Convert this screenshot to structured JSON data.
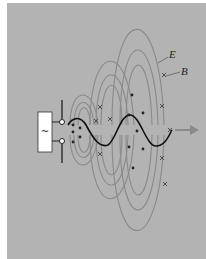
{
  "figure": {
    "labels": {
      "electric_field": "E",
      "magnetic_field": "B",
      "source_symbol": "~"
    },
    "colors": {
      "background": "#b3b3b3",
      "field_lines": "#8a8a8a",
      "wave": "#111111",
      "source_box": "#ffffff",
      "arrow": "#8a8a8a"
    },
    "legend": [
      {
        "symbol": "dot",
        "meaning": "B field out of page"
      },
      {
        "symbol": "cross",
        "meaning": "B field into page"
      }
    ]
  }
}
